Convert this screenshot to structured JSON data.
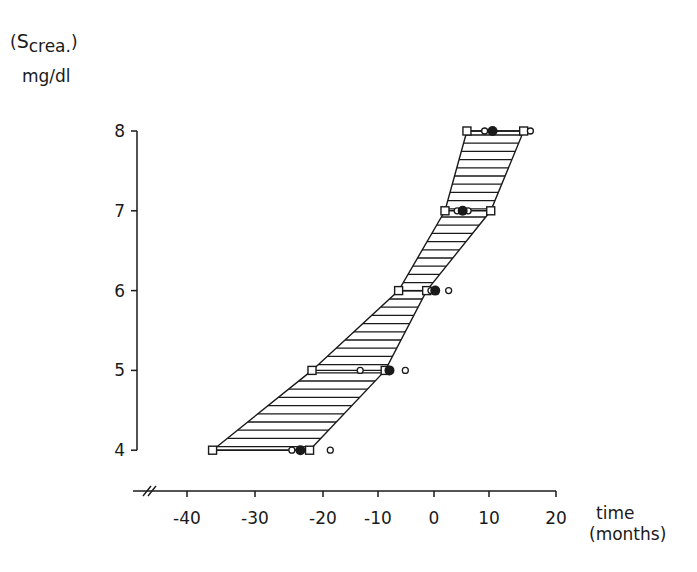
{
  "chart_data": {
    "type": "scatter",
    "title": "",
    "ylabel": "(S crea.) mg/dl",
    "ylabel_parts": {
      "open": "(",
      "symbol": "S",
      "subscript": "crea.",
      "close": ")",
      "unit": "mg/dl"
    },
    "xlabel": "time (months)",
    "xlabel_parts": {
      "line1": "time",
      "line2": "(months)"
    },
    "xlim": [
      -47,
      20
    ],
    "ylim": [
      4,
      8
    ],
    "x_ticks": [
      -40,
      -30,
      -20,
      -10,
      0,
      10,
      20
    ],
    "x_tick_labels": [
      "-40",
      "-30",
      "-20",
      "-10",
      "0",
      "10",
      "20"
    ],
    "y_ticks": [
      4,
      5,
      6,
      7,
      8
    ],
    "y_tick_labels": [
      "4",
      "5",
      "6",
      "7",
      "8"
    ],
    "grid": false,
    "axis_break": "x-axis break mark (//) at left end",
    "legend": null,
    "shaded_band": {
      "description": "Hatched band (horizontal lines) between lower and upper boundary squares",
      "hatching": "horizontal lines",
      "left_boundary": [
        {
          "y": 4,
          "x": -36.3
        },
        {
          "y": 5,
          "x": -20.0
        },
        {
          "y": 6,
          "x": -5.8
        },
        {
          "y": 7,
          "x": 1.8
        },
        {
          "y": 8,
          "x": 5.4
        }
      ],
      "right_boundary": [
        {
          "y": 4,
          "x": -20.4
        },
        {
          "y": 5,
          "x": -8.0
        },
        {
          "y": 6,
          "x": -1.2
        },
        {
          "y": 7,
          "x": 9.3
        },
        {
          "y": 8,
          "x": 14.7
        }
      ]
    },
    "series": [
      {
        "name": "band limits",
        "marker": "open-square",
        "points": [
          {
            "x": -36.3,
            "y": 4
          },
          {
            "x": -20.4,
            "y": 4
          },
          {
            "x": -20.0,
            "y": 5
          },
          {
            "x": -8.0,
            "y": 5
          },
          {
            "x": -5.8,
            "y": 6
          },
          {
            "x": -1.2,
            "y": 6
          },
          {
            "x": 1.8,
            "y": 7
          },
          {
            "x": 9.3,
            "y": 7
          },
          {
            "x": 5.4,
            "y": 8
          },
          {
            "x": 14.7,
            "y": 8
          }
        ]
      },
      {
        "name": "individual values",
        "marker": "open-circle",
        "points": [
          {
            "x": -23.3,
            "y": 4
          },
          {
            "x": -17.0,
            "y": 4
          },
          {
            "x": -12.1,
            "y": 5
          },
          {
            "x": -4.7,
            "y": 5
          },
          {
            "x": -0.5,
            "y": 6
          },
          {
            "x": 2.4,
            "y": 6
          },
          {
            "x": 3.8,
            "y": 7
          },
          {
            "x": 5.6,
            "y": 7
          },
          {
            "x": 8.3,
            "y": 8
          },
          {
            "x": 15.8,
            "y": 8
          }
        ]
      },
      {
        "name": "mean",
        "marker": "filled-circle",
        "points": [
          {
            "x": -21.9,
            "y": 4
          },
          {
            "x": -7.3,
            "y": 5
          },
          {
            "x": 0.2,
            "y": 6
          },
          {
            "x": 4.7,
            "y": 7
          },
          {
            "x": 9.6,
            "y": 8
          }
        ]
      }
    ]
  }
}
